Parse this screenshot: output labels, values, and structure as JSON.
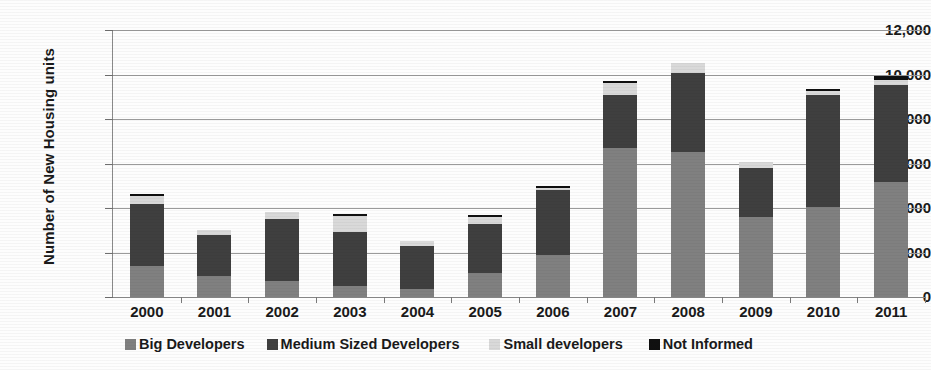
{
  "chart_data": {
    "type": "bar",
    "stacked": true,
    "title": "",
    "xlabel": "",
    "ylabel": "Number of New Housing units",
    "ylim": [
      0,
      12000
    ],
    "ytick_step": 2000,
    "ytick_labels": [
      "12,000",
      "10,000",
      "8,000",
      "6,000",
      "4,000",
      "2,000",
      "0"
    ],
    "ytick_values": [
      12000,
      10000,
      8000,
      6000,
      4000,
      2000,
      0
    ],
    "grid": true,
    "legend_position": "bottom",
    "categories": [
      "2000",
      "2001",
      "2002",
      "2003",
      "2004",
      "2005",
      "2006",
      "2007",
      "2008",
      "2009",
      "2010",
      "2011"
    ],
    "series": [
      {
        "name": "Big Developers",
        "color": "#808080",
        "values": [
          1400,
          950,
          700,
          500,
          350,
          1100,
          1900,
          6700,
          6500,
          3600,
          4050,
          5150
        ]
      },
      {
        "name": "Medium Sized Developers",
        "color": "#3f3f3f",
        "values": [
          2800,
          1850,
          2800,
          2400,
          1950,
          2200,
          2900,
          2400,
          3550,
          2200,
          5050,
          4400
        ]
      },
      {
        "name": "Small developers",
        "color": "#d9d9d9",
        "values": [
          350,
          200,
          300,
          750,
          200,
          300,
          100,
          500,
          450,
          250,
          150,
          200
        ]
      },
      {
        "name": "Not Informed",
        "color": "#101010",
        "values": [
          100,
          0,
          0,
          100,
          0,
          80,
          100,
          100,
          0,
          0,
          100,
          180
        ]
      }
    ],
    "totals": [
      4650,
      3000,
      3800,
      3750,
      2500,
      3680,
      5000,
      9700,
      10500,
      6050,
      9350,
      9930
    ]
  }
}
